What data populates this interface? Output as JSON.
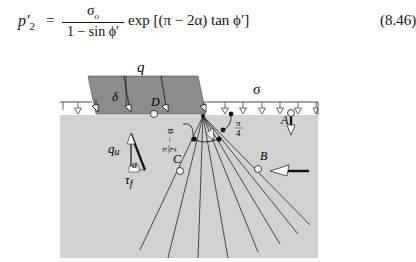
{
  "equation": {
    "lhs_symbol": "p′",
    "lhs_subscript": "2",
    "equals": "=",
    "numerator_symbol": "σ",
    "numerator_subscript": "o",
    "denominator": "1 − sin ϕ′",
    "rest": "exp [(π − 2α) tan ϕ′]",
    "number": "(8.46)"
  },
  "diagram": {
    "labels": {
      "footing_load": "q",
      "surcharge": "σ",
      "wall_friction": "δ",
      "point_a": "A",
      "point_b": "B",
      "point_c": "C",
      "point_d": "D",
      "normal_stress": "q",
      "normal_stress_sub": "u",
      "shear_stress": "τ",
      "shear_stress_sub": "f",
      "alpha": "α",
      "angle_left_num": "π",
      "angle_left_den": "2",
      "angle_left_suffix": "− α",
      "angle_right_num": "π",
      "angle_right_den": "4"
    },
    "colors": {
      "soil": "#d2d2d2",
      "footing": "#8c8c8c",
      "lines": "#1a1a1a",
      "background": "#ffffff"
    }
  }
}
